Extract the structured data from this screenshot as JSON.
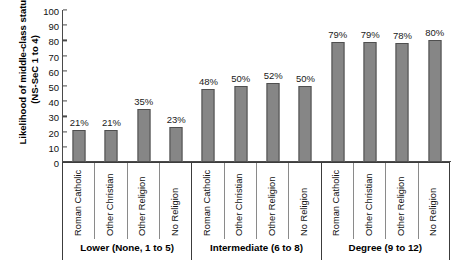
{
  "chart_data": {
    "type": "bar",
    "title": "",
    "xlabel": "",
    "ylabel": "Likelihood of middle-class status (NS-SeC 1 to 4)",
    "ylabel_line1": "Likelihood of middle-class status",
    "ylabel_line2": "(NS-SeC 1 to 4)",
    "ylim": [
      0,
      100
    ],
    "yticks": [
      0,
      10,
      20,
      30,
      40,
      50,
      60,
      70,
      80,
      90,
      100
    ],
    "ytick_labels": [
      "0",
      "10",
      "20",
      "30",
      "40",
      "50",
      "60",
      "70",
      "80",
      "90",
      "100"
    ],
    "grid": false,
    "legend": "none",
    "bar_color": "#868686",
    "bar_border_color": "#4f4f4f",
    "axis_color": "#4a4a4a",
    "categories": [
      "Roman Catholic",
      "Other Christian",
      "Other Religion",
      "No Religion",
      "Roman Catholic",
      "Other Christian",
      "Other Religion",
      "No Religion",
      "Roman Catholic",
      "Other Christian",
      "Other Religion",
      "No Religion"
    ],
    "values": [
      21,
      21,
      35,
      23,
      48,
      50,
      52,
      50,
      79,
      79,
      78,
      80
    ],
    "data_labels": [
      "21%",
      "21%",
      "35%",
      "23%",
      "48%",
      "50%",
      "52%",
      "50%",
      "79%",
      "79%",
      "78%",
      "80%"
    ],
    "groups": [
      {
        "label": "Lower (None, 1 to 5)",
        "start": 0,
        "count": 4
      },
      {
        "label": "Intermediate (6 to 8)",
        "start": 4,
        "count": 4
      },
      {
        "label": "Degree (9 to 12)",
        "start": 8,
        "count": 4
      }
    ]
  }
}
